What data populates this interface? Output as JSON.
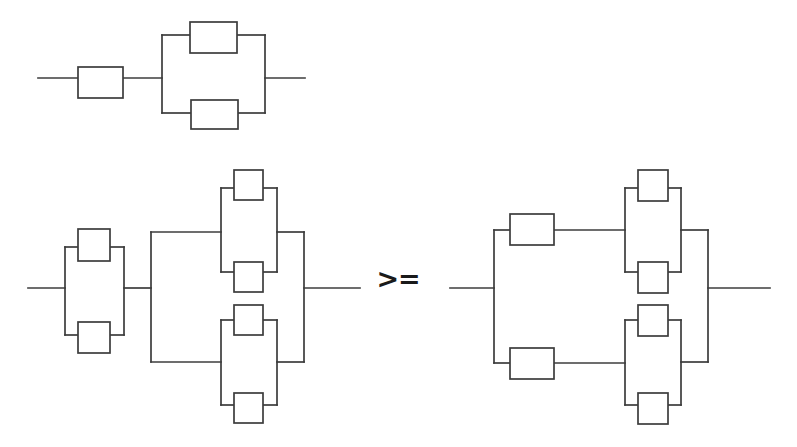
{
  "figure": {
    "kind": "reliability-block-diagram",
    "background_color": "#ffffff",
    "line_color": "#3c3c3c",
    "block_fill": "#ffffff",
    "relation_symbol": ">=",
    "relation_symbol_position": {
      "x": 398,
      "y": 288
    },
    "canvas": {
      "width": 797,
      "height": 447
    },
    "diagrams": [
      {
        "id": "top",
        "name": "series-parallel-diagram-top",
        "label": "",
        "blocks": [
          {
            "id": "t1",
            "name": "block-t1",
            "x": 78,
            "y": 67,
            "w": 45,
            "h": 31,
            "label": ""
          },
          {
            "id": "t2",
            "name": "block-t2",
            "x": 190,
            "y": 22,
            "w": 47,
            "h": 31,
            "label": ""
          },
          {
            "id": "t3",
            "name": "block-t3",
            "x": 191,
            "y": 100,
            "w": 47,
            "h": 29,
            "label": ""
          }
        ],
        "wires": [
          "M38,78 L78,78",
          "M123,78 L162,78",
          "M162,35 L162,113",
          "M162,35 L190,35",
          "M162,113 L191,113",
          "M237,35 L265,35",
          "M238,113 L265,113",
          "M265,35 L265,113",
          "M265,78 L305,78"
        ]
      },
      {
        "id": "bottom-left",
        "name": "series-parallel-diagram-bottom-left",
        "label": "",
        "blocks": [
          {
            "id": "l1",
            "name": "block-l1",
            "x": 78,
            "y": 229,
            "w": 32,
            "h": 32,
            "label": ""
          },
          {
            "id": "l2",
            "name": "block-l2",
            "x": 78,
            "y": 322,
            "w": 32,
            "h": 31,
            "label": ""
          },
          {
            "id": "l3",
            "name": "block-l3",
            "x": 234,
            "y": 170,
            "w": 29,
            "h": 30,
            "label": ""
          },
          {
            "id": "l4",
            "name": "block-l4",
            "x": 234,
            "y": 262,
            "w": 29,
            "h": 30,
            "label": ""
          },
          {
            "id": "l5",
            "name": "block-l5",
            "x": 234,
            "y": 305,
            "w": 29,
            "h": 30,
            "label": ""
          },
          {
            "id": "l6",
            "name": "block-l6",
            "x": 234,
            "y": 393,
            "w": 29,
            "h": 30,
            "label": ""
          }
        ],
        "wires": [
          "M28,288 L65,288",
          "M65,247 L65,335",
          "M65,247 L78,247",
          "M65,335 L78,335",
          "M110,247 L124,247",
          "M110,335 L124,335",
          "M124,247 L124,335",
          "M124,288 L151,288",
          "M151,232 L151,362",
          "M151,232 L221,232",
          "M151,362 L221,362",
          "M221,188 L221,272",
          "M221,188 L234,188",
          "M221,272 L234,272",
          "M263,188 L277,188",
          "M263,272 L277,272",
          "M277,188 L277,272",
          "M277,232 L304,232",
          "M221,320 L221,405",
          "M221,320 L234,320",
          "M221,405 L234,405",
          "M263,320 L277,320",
          "M263,405 L277,405",
          "M277,320 L277,405",
          "M277,362 L304,362",
          "M304,232 L304,362",
          "M304,288 L360,288"
        ]
      },
      {
        "id": "bottom-right",
        "name": "series-parallel-diagram-bottom-right",
        "label": "",
        "blocks": [
          {
            "id": "r1",
            "name": "block-r1",
            "x": 510,
            "y": 214,
            "w": 44,
            "h": 31,
            "label": ""
          },
          {
            "id": "r2",
            "name": "block-r2",
            "x": 510,
            "y": 348,
            "w": 44,
            "h": 31,
            "label": ""
          },
          {
            "id": "r3",
            "name": "block-r3",
            "x": 638,
            "y": 170,
            "w": 30,
            "h": 31,
            "label": ""
          },
          {
            "id": "r4",
            "name": "block-r4",
            "x": 638,
            "y": 262,
            "w": 30,
            "h": 31,
            "label": ""
          },
          {
            "id": "r5",
            "name": "block-r5",
            "x": 638,
            "y": 305,
            "w": 30,
            "h": 31,
            "label": ""
          },
          {
            "id": "r6",
            "name": "block-r6",
            "x": 638,
            "y": 393,
            "w": 30,
            "h": 31,
            "label": ""
          }
        ],
        "wires": [
          "M450,288 L494,288",
          "M494,230 L494,363",
          "M494,230 L510,230",
          "M494,363 L510,363",
          "M554,230 L625,230",
          "M554,363 L625,363",
          "M625,188 L625,272",
          "M625,188 L638,188",
          "M625,272 L638,272",
          "M668,188 L681,188",
          "M668,272 L681,272",
          "M681,188 L681,272",
          "M681,230 L708,230",
          "M625,320 L625,405",
          "M625,320 L638,320",
          "M625,405 L638,405",
          "M668,320 L681,320",
          "M668,405 L681,405",
          "M681,320 L681,405",
          "M681,362 L708,362",
          "M708,230 L708,362",
          "M708,288 L770,288"
        ]
      }
    ]
  }
}
